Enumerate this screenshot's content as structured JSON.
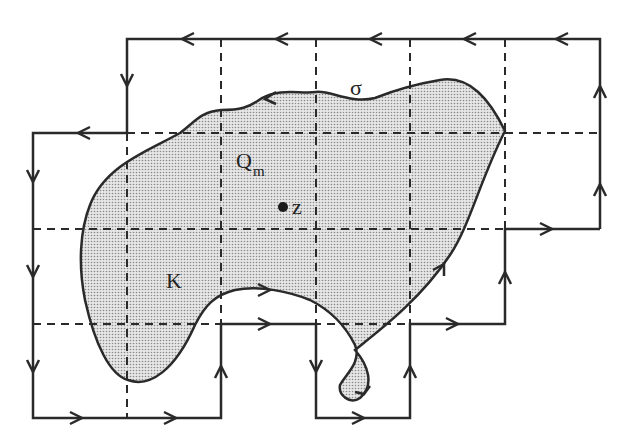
{
  "figure": {
    "labels": {
      "sigma": "σ",
      "region": "K",
      "square": "Q",
      "square_sub": "m",
      "point": "z"
    },
    "colors": {
      "stroke": "#2a2a2a",
      "fill_region": "#d9d9d9",
      "background": "#ffffff"
    },
    "grid": {
      "x": [
        33,
        127,
        221,
        316,
        410,
        505,
        600
      ],
      "y": [
        39,
        133,
        229,
        324,
        418
      ]
    }
  }
}
